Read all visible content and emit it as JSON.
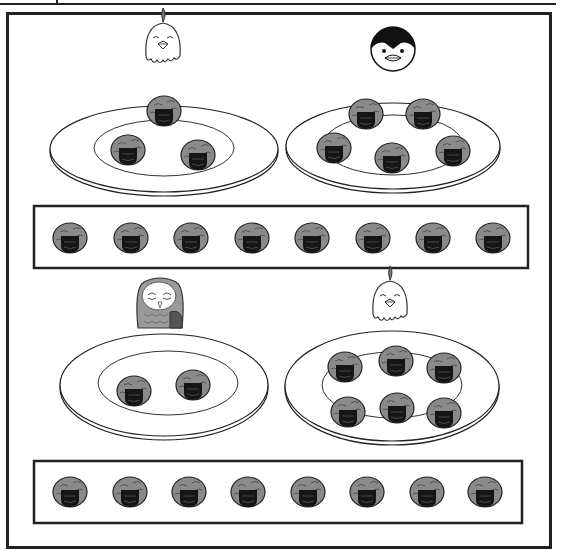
{
  "worksheet": {
    "title": "Onigiri counting worksheet",
    "colors": {
      "rice": "#8a8a8a",
      "nori": "#1a1a1a",
      "outline": "#222222",
      "background": "#ffffff"
    },
    "sections": [
      {
        "plates": [
          {
            "animal": "chicken",
            "onigiri_count": 3
          },
          {
            "animal": "penguin",
            "onigiri_count": 5
          }
        ],
        "answer_strip": {
          "onigiri_count": 8
        }
      },
      {
        "plates": [
          {
            "animal": "owl",
            "onigiri_count": 2
          },
          {
            "animal": "chicken",
            "onigiri_count": 6
          }
        ],
        "answer_strip": {
          "onigiri_count": 8
        }
      }
    ]
  }
}
